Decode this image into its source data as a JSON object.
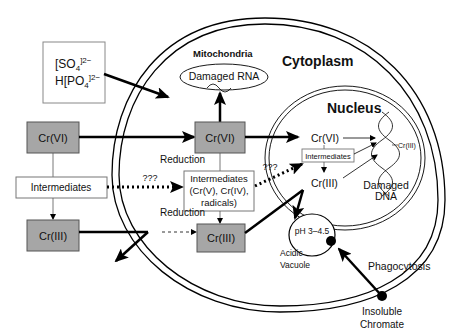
{
  "labels": {
    "sulfate": "[SO",
    "sulfate_sub": "4",
    "sulfate_sup": "]2−",
    "phosphate": "H[PO",
    "phosphate_sub": "4",
    "phosphate_sup": "]2−",
    "mitochondria": "Mitochondria",
    "damaged_rna": "Damaged RNA",
    "cytoplasm": "Cytoplasm",
    "nucleus": "Nucleus",
    "ext_cr6": "Cr(VI)",
    "ext_intermediates": "Intermediates",
    "ext_cr3": "Cr(III)",
    "cyto_cr6": "Cr(VI)",
    "reduction_1": "Reduction",
    "cyto_intermediates_1": "Intermediates",
    "cyto_intermediates_2": "(Cr(V), Cr(IV),",
    "cyto_intermediates_3": "radicals)",
    "reduction_2": "Reduction",
    "cyto_cr3": "Cr(III)",
    "unknown_1": "???",
    "unknown_2": "???",
    "nuc_cr6": "Cr(VI)",
    "nuc_intermediates": "Intermediates",
    "nuc_cr3": "Cr(III)",
    "dna_cr3": "Cr(III)",
    "damaged_dna_1": "Damaged",
    "damaged_dna_2": "DNA",
    "ph": "pH 3–4.5",
    "acidic_vacuole_1": "Acidic",
    "acidic_vacuole_2": "Vacuole",
    "phagocytosis": "Phagocytosis",
    "insoluble_1": "Insoluble",
    "insoluble_2": "Chromate"
  },
  "colors": {
    "box_gray": "#a6a6a6",
    "line": "#000000"
  }
}
